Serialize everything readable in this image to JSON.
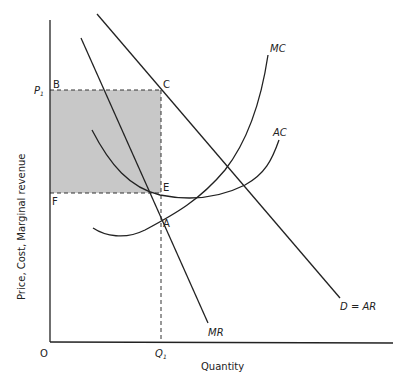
{
  "diagram": {
    "axes": {
      "x_label": "Quantity",
      "y_label": "Price, Cost, Marginal revenue",
      "origin": "O"
    },
    "ticks": {
      "p1_main": "P",
      "p1_sub": "1",
      "q1_main": "Q",
      "q1_sub": "1"
    },
    "points": {
      "B": "B",
      "C": "C",
      "E": "E",
      "F": "F",
      "A": "A"
    },
    "curves": {
      "mc": "MC",
      "ac": "AC",
      "mr": "MR",
      "demand": "D = AR"
    },
    "colors": {
      "line": "#222222",
      "shade": "#c8c8c8"
    }
  }
}
